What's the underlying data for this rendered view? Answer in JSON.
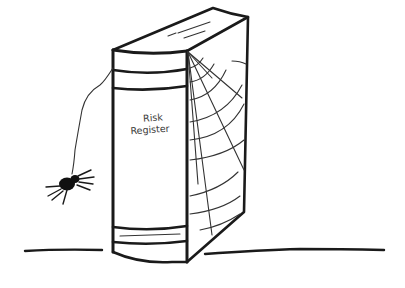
{
  "illustration": {
    "subject": "Hand-drawn book with cobwebs and a hanging spider",
    "book": {
      "spine_label_line1": "Risk",
      "spine_label_line2": "Register"
    },
    "colors": {
      "ink": "#1a1a1a",
      "background": "#ffffff"
    }
  }
}
